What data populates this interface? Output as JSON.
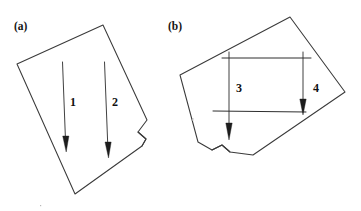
{
  "figure": {
    "background_color": "#ffffff",
    "ink_color": "#3a3a3a",
    "width": 361,
    "height": 211,
    "panels": [
      {
        "id": "a",
        "label": "(a)",
        "label_x": 14,
        "label_y": 30,
        "description": "tilted quadrilateral sheet with curled right edge",
        "sheet_points": "17,64 103,25 147,120 138,132 146,139 142,146 75,194",
        "curl_points": "138,132 146,139 142,146",
        "arrows": [
          {
            "number": "1",
            "label_x": 70,
            "label_y": 106,
            "shaft_x1": 62.5,
            "shaft_y1": 62,
            "shaft_x2": 65.5,
            "shaft_y2": 140,
            "tip_x": 66.2,
            "tip_y": 152,
            "head_width": 3.1
          },
          {
            "number": "2",
            "label_x": 112,
            "label_y": 106,
            "shaft_x1": 104.5,
            "shaft_y1": 62,
            "shaft_x2": 107.8,
            "shaft_y2": 146,
            "tip_x": 108.5,
            "tip_y": 158,
            "head_width": 3.1
          }
        ]
      },
      {
        "id": "b",
        "label": "(b)",
        "label_x": 168,
        "label_y": 30,
        "description": "tilted quadrilateral sheet with notch at bottom-left and rectangular guide lines",
        "sheet_points": "180,75 290,17 345,92 253,155 230,152 222,145 212,150 198,142",
        "curl_points": "230,152 222,145 212,150",
        "guides": [
          {
            "name": "top-horizontal",
            "x1": 222,
            "y1": 58,
            "x2": 311,
            "y2": 58
          },
          {
            "name": "bottom-horizontal",
            "x1": 213,
            "y1": 111,
            "x2": 306,
            "y2": 112
          }
        ],
        "arrows": [
          {
            "number": "3",
            "label_x": 236,
            "label_y": 92,
            "shaft_x1": 229,
            "shaft_y1": 52,
            "shaft_x2": 229,
            "shaft_y2": 127,
            "tip_x": 229,
            "tip_y": 140,
            "head_width": 3.2
          },
          {
            "number": "4",
            "label_x": 313,
            "label_y": 92,
            "shaft_x1": 303,
            "shaft_y1": 52,
            "shaft_x2": 303,
            "shaft_y2": 103,
            "tip_x": 303,
            "tip_y": 115,
            "head_width": 3.2
          }
        ]
      }
    ],
    "specks": [
      {
        "x": 192,
        "y": 118,
        "w": 1.4,
        "h": 2.6
      },
      {
        "x": 40,
        "y": 205,
        "w": 1.2,
        "h": 1.2
      }
    ]
  }
}
